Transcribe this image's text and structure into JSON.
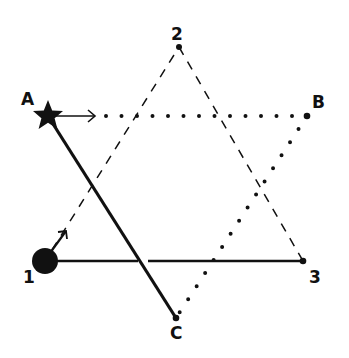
{
  "diagram": {
    "points": {
      "1": {
        "label": "1",
        "x": 45,
        "y": 261,
        "marker": "large-filled-circle"
      },
      "2": {
        "label": "2",
        "x": 179,
        "y": 47,
        "marker": "dot"
      },
      "3": {
        "label": "3",
        "x": 303,
        "y": 261,
        "marker": "dot"
      },
      "A": {
        "label": "A",
        "x": 48,
        "y": 116,
        "marker": "filled-star"
      },
      "B": {
        "label": "B",
        "x": 307,
        "y": 116,
        "marker": "dot"
      },
      "C": {
        "label": "C",
        "x": 176,
        "y": 318,
        "marker": "dot"
      }
    },
    "edges": [
      {
        "from": "1",
        "to": "2",
        "style": "dashed"
      },
      {
        "from": "2",
        "to": "3",
        "style": "dashed"
      },
      {
        "from": "1",
        "to": "3",
        "style": "solid"
      },
      {
        "from": "A",
        "to": "B",
        "style": "dotted"
      },
      {
        "from": "B",
        "to": "C",
        "style": "dotted"
      },
      {
        "from": "A",
        "to": "C",
        "style": "solid-thick"
      }
    ],
    "arrows": [
      {
        "from": "A",
        "direction": "toward B"
      },
      {
        "from": "1",
        "direction": "toward 2"
      }
    ],
    "colors": {
      "ink": "#111111",
      "background": "#ffffff"
    }
  }
}
